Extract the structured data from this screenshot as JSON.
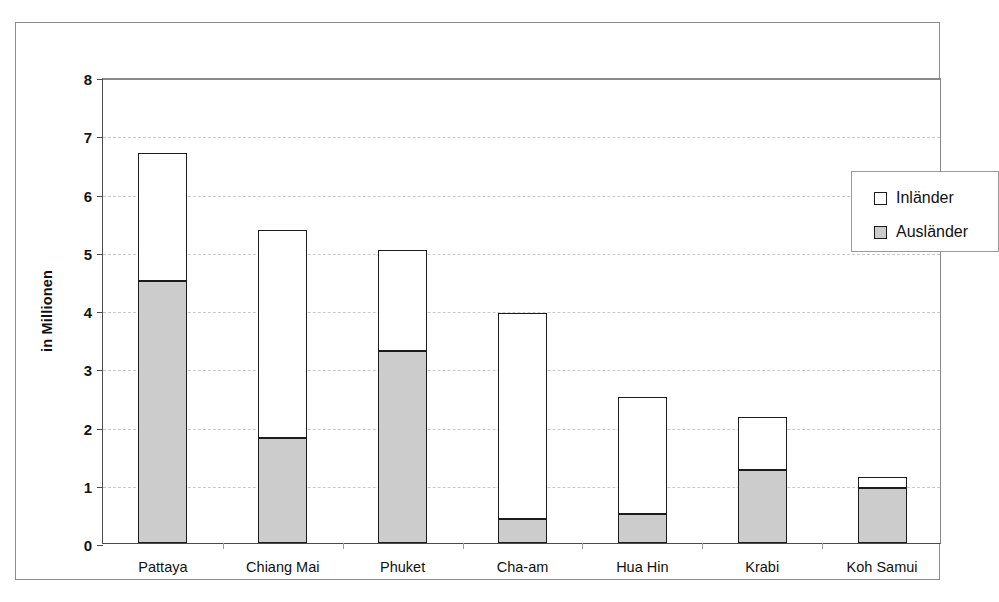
{
  "chart_data": {
    "type": "bar",
    "subtype": "stacked-vertical",
    "title": "",
    "xlabel": "",
    "ylabel": "in Millionen",
    "ylim": [
      0,
      8
    ],
    "yticks": [
      0,
      1,
      2,
      3,
      4,
      5,
      6,
      7,
      8
    ],
    "ytick_labels": [
      "0",
      "1",
      "2",
      "3",
      "4",
      "5",
      "6",
      "7",
      "8"
    ],
    "grid": true,
    "grid_axis": "y",
    "grid_style": "dashed",
    "legend_position": "top-right-inside",
    "categories": [
      "Pattaya",
      "Chiang Mai",
      "Phuket",
      "Cha-am",
      "Hua Hin",
      "Krabi",
      "Koh Samui"
    ],
    "series": [
      {
        "name": "Ausländer",
        "color": "#cccccc",
        "stack_order": "bottom",
        "values": [
          4.5,
          1.8,
          3.3,
          0.42,
          0.5,
          1.25,
          0.95
        ]
      },
      {
        "name": "Inländer",
        "color": "#ffffff",
        "stack_order": "top",
        "values": [
          2.2,
          3.58,
          1.73,
          3.53,
          2.0,
          0.92,
          0.18
        ]
      }
    ],
    "totals": [
      6.7,
      5.38,
      5.03,
      3.95,
      2.5,
      2.17,
      1.13
    ]
  },
  "legend": {
    "entries": [
      {
        "label": "Inländer",
        "swatch": "white"
      },
      {
        "label": "Ausländer",
        "swatch": "gray"
      }
    ]
  },
  "axis": {
    "y_title": "in Millionen"
  },
  "colors": {
    "auslaender_fill": "#cccccc",
    "inlaender_fill": "#ffffff",
    "bar_outline": "#1c1c1c",
    "grid": "#c9c9cf",
    "frame": "#8c8c8c",
    "text": "#111111"
  }
}
